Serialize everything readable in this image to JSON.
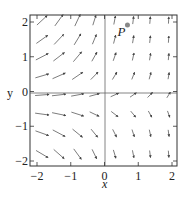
{
  "chart_data": {
    "type": "quiver",
    "title": "",
    "xlabel": "x",
    "ylabel": "y",
    "xlim": [
      -2.2,
      2.2
    ],
    "ylim": [
      -2.2,
      2.2
    ],
    "grid": false,
    "xticks": [
      -2,
      -1,
      0,
      1,
      2
    ],
    "yticks": [
      -2,
      -1,
      0,
      1,
      2
    ],
    "xtick_labels": [
      "−2",
      "−1",
      "0",
      "1",
      "2"
    ],
    "ytick_labels": [
      "−2",
      "−1",
      "0",
      "1",
      "2"
    ],
    "axes_lines": {
      "x0": true,
      "y0": true
    },
    "grid_points": {
      "x": [
        -1.85,
        -1.35,
        -0.8,
        -0.3,
        0.3,
        0.85,
        1.35,
        1.9
      ],
      "y": [
        2.05,
        1.5,
        1.0,
        0.45,
        -0.1,
        -0.65,
        -1.2,
        -1.8
      ]
    },
    "field_description": "Vectors point rightward on the left side (long, tilting upward as y increases); on the right side they are very short and nearly vertical (up at top, slightly down-left at bottom).",
    "annotations": [
      {
        "label": "P",
        "x": 0.65,
        "y": 2.0,
        "marker": "dot",
        "color": "#888888"
      }
    ],
    "colors": {
      "frame": "#333333",
      "axes": "#555555",
      "arrows": "#444444",
      "point": "#8a8a8a"
    }
  }
}
